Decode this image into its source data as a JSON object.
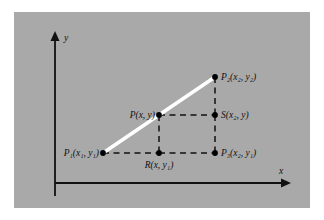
{
  "figure": {
    "kind": "coordinate-geometry-diagram",
    "caption": "",
    "panel_color": "#a9a9a9",
    "page_color": "#ffffff",
    "segment_color": "#ffffff",
    "ink_color": "#111111"
  },
  "axes": {
    "x_label": "x",
    "y_label": "y",
    "x_axis_y": 183,
    "y_axis_x": 55,
    "x_axis_start": 55,
    "x_axis_end": 290,
    "y_axis_top": 32,
    "y_axis_bottom": 196,
    "arrowheads": true,
    "grid": false
  },
  "points": [
    {
      "id": "P1",
      "x": 103,
      "y": 153,
      "label_base": "P",
      "label_sub": "1",
      "label_args": "(x₁, y₁)",
      "label_full": "P₁(x₁, y₁)",
      "label_x": 99,
      "label_y": 156,
      "label_anchor": "end"
    },
    {
      "id": "P",
      "x": 159,
      "y": 115,
      "label_base": "P",
      "label_sub": "",
      "label_args": "(x, y)",
      "label_full": "P(x, y)",
      "label_x": 155,
      "label_y": 118,
      "label_anchor": "end"
    },
    {
      "id": "S",
      "x": 215,
      "y": 115,
      "label_base": "S",
      "label_sub": "",
      "label_args": "(x₂, y)",
      "label_full": "S(x₂, y)",
      "label_x": 221,
      "label_y": 118,
      "label_anchor": "start"
    },
    {
      "id": "P2",
      "x": 215,
      "y": 77,
      "label_base": "P",
      "label_sub": "2",
      "label_args": "(x₂, y₂)",
      "label_full": "P₂(x₂, y₂)",
      "label_x": 221,
      "label_y": 80,
      "label_anchor": "start"
    },
    {
      "id": "R",
      "x": 159,
      "y": 153,
      "label_base": "R",
      "label_sub": "",
      "label_args": "(x, y₁)",
      "label_full": "R(x, y₁)",
      "label_x": 159,
      "label_y": 168,
      "label_anchor": "middle"
    },
    {
      "id": "P3",
      "x": 215,
      "y": 153,
      "label_base": "P",
      "label_sub": "3",
      "label_args": "(x₂, y₁)",
      "label_full": "P₃(x₂, y₁)",
      "label_x": 221,
      "label_y": 156,
      "label_anchor": "start"
    }
  ],
  "segments": {
    "solid_white": {
      "from": "P1",
      "to": "P2",
      "x1": 103,
      "y1": 153,
      "x2": 215,
      "y2": 77
    },
    "dashed": [
      {
        "name": "P1-to-R",
        "x1": 103,
        "y1": 153,
        "x2": 159,
        "y2": 153
      },
      {
        "name": "R-to-P3",
        "x1": 159,
        "y1": 153,
        "x2": 215,
        "y2": 153
      },
      {
        "name": "P-to-S",
        "x1": 159,
        "y1": 115,
        "x2": 215,
        "y2": 115
      },
      {
        "name": "P-to-R",
        "x1": 159,
        "y1": 115,
        "x2": 159,
        "y2": 153
      },
      {
        "name": "P2-to-S",
        "x1": 215,
        "y1": 77,
        "x2": 215,
        "y2": 115
      },
      {
        "name": "S-to-P3",
        "x1": 215,
        "y1": 115,
        "x2": 215,
        "y2": 153
      }
    ]
  },
  "axis_labels": {
    "y": {
      "text": "y",
      "x": 64,
      "y": 41
    },
    "x": {
      "text": "x",
      "x": 281,
      "y": 174
    }
  }
}
